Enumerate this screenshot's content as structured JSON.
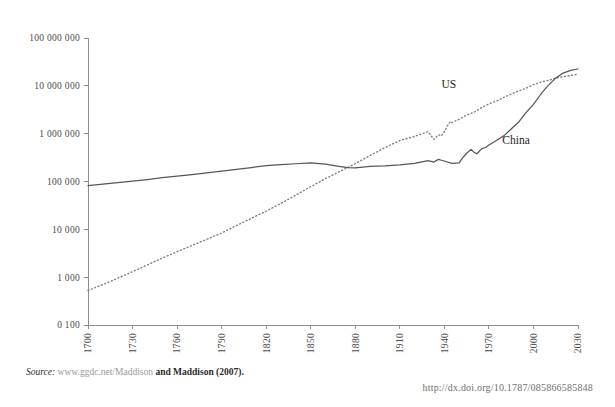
{
  "chart_data": {
    "type": "line",
    "title": "",
    "subtitle": "",
    "xlabel": "",
    "ylabel": "",
    "yscale": "log",
    "xlim": [
      1700,
      2030
    ],
    "ylim": [
      100,
      100000000
    ],
    "grid": false,
    "legend_position": "inline-annotation",
    "xticks": [
      "1700",
      "1730",
      "1760",
      "1790",
      "1820",
      "1850",
      "1880",
      "1910",
      "1940",
      "1970",
      "2000",
      "2030"
    ],
    "xtick_values": [
      1700,
      1730,
      1760,
      1790,
      1820,
      1850,
      1880,
      1910,
      1940,
      1970,
      2000,
      2030
    ],
    "yticks": [
      "0 100",
      "1 000",
      "10 000",
      "100 000",
      "1 000 000",
      "10 000 000",
      "100 000 000"
    ],
    "ytick_values": [
      100,
      1000,
      10000,
      100000,
      1000000,
      10000000,
      100000000
    ],
    "annotations": [
      {
        "text": "US",
        "x": 1938,
        "y": 9000000
      },
      {
        "text": "China",
        "x": 1979,
        "y": 620000
      }
    ],
    "series": [
      {
        "name": "China",
        "style": "solid",
        "color": "#565656",
        "x": [
          1700,
          1710,
          1720,
          1730,
          1740,
          1750,
          1760,
          1770,
          1780,
          1790,
          1800,
          1810,
          1820,
          1830,
          1840,
          1850,
          1860,
          1870,
          1875,
          1880,
          1885,
          1890,
          1900,
          1910,
          1920,
          1929,
          1933,
          1936,
          1938,
          1941,
          1945,
          1950,
          1952,
          1955,
          1958,
          1960,
          1962,
          1965,
          1968,
          1970,
          1975,
          1980,
          1985,
          1990,
          1995,
          2000,
          2003,
          2006,
          2010,
          2015,
          2020,
          2025,
          2030
        ],
        "y": [
          82000,
          88000,
          95000,
          102000,
          110000,
          120000,
          130000,
          140000,
          152000,
          165000,
          180000,
          196000,
          215000,
          225000,
          235000,
          244000,
          230000,
          205000,
          195000,
          192000,
          200000,
          206000,
          212000,
          222000,
          240000,
          272000,
          255000,
          290000,
          278000,
          262000,
          240000,
          245000,
          305000,
          390000,
          470000,
          410000,
          380000,
          480000,
          520000,
          580000,
          720000,
          900000,
          1250000,
          1750000,
          2750000,
          4100000,
          5500000,
          7400000,
          10200000,
          14500000,
          18500000,
          21000000,
          22500000
        ]
      },
      {
        "name": "US",
        "style": "dotted",
        "color": "#7d7d7d",
        "x": [
          1700,
          1710,
          1720,
          1730,
          1740,
          1750,
          1760,
          1770,
          1780,
          1790,
          1800,
          1810,
          1820,
          1830,
          1840,
          1850,
          1860,
          1870,
          1880,
          1890,
          1900,
          1910,
          1920,
          1929,
          1933,
          1936,
          1938,
          1940,
          1942,
          1944,
          1945,
          1950,
          1955,
          1960,
          1965,
          1970,
          1975,
          1980,
          1985,
          1990,
          1995,
          2000,
          2005,
          2010,
          2015,
          2020,
          2025,
          2030
        ],
        "y": [
          527,
          700,
          950,
          1300,
          1800,
          2500,
          3400,
          4600,
          6200,
          8400,
          12000,
          17000,
          24000,
          35000,
          52000,
          78000,
          115000,
          165000,
          235000,
          350000,
          510000,
          720000,
          880000,
          1100000,
          760000,
          950000,
          900000,
          1100000,
          1450000,
          1800000,
          1700000,
          2000000,
          2450000,
          2800000,
          3500000,
          4200000,
          4800000,
          5700000,
          6700000,
          7800000,
          8900000,
          10600000,
          12000000,
          13000000,
          14500000,
          15500000,
          16500000,
          17500000
        ]
      }
    ]
  },
  "footer": {
    "source_label": "Source:",
    "source_url": "www.ggdc.net/Maddison",
    "source_tail": "and Maddison (2007).",
    "doi": "http://dx.doi.org/10.1787/085866585848"
  }
}
